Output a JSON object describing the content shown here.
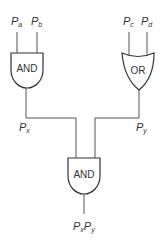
{
  "diagram": {
    "type": "logic-gate-circuit",
    "inputs": [
      {
        "id": "a",
        "symbol": "P",
        "subscript": "a"
      },
      {
        "id": "b",
        "symbol": "P",
        "subscript": "b"
      },
      {
        "id": "c",
        "symbol": "P",
        "subscript": "c"
      },
      {
        "id": "d",
        "symbol": "P",
        "subscript": "d"
      }
    ],
    "gates": [
      {
        "id": "gate1",
        "type": "AND",
        "label": "AND",
        "inputs": [
          "a",
          "b"
        ],
        "output": "x"
      },
      {
        "id": "gate2",
        "type": "OR",
        "label": "OR",
        "inputs": [
          "c",
          "d"
        ],
        "output": "y"
      },
      {
        "id": "gate3",
        "type": "AND",
        "label": "AND",
        "inputs": [
          "x",
          "y"
        ],
        "output": "xy"
      }
    ],
    "intermediate": [
      {
        "id": "x",
        "symbol": "P",
        "subscript": "x"
      },
      {
        "id": "y",
        "symbol": "P",
        "subscript": "y"
      }
    ],
    "output": {
      "id": "xy",
      "parts": [
        {
          "symbol": "P",
          "subscript": "x"
        },
        {
          "symbol": "P",
          "subscript": "y"
        }
      ]
    }
  }
}
